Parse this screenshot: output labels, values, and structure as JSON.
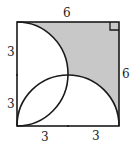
{
  "diagram": {
    "type": "geometry",
    "shape": "square",
    "shaded_region_color": "#c8c8c8",
    "stroke_color": "#1a1a1a",
    "labels": {
      "top": "6",
      "right": "6",
      "left_upper": "3",
      "left_lower": "3",
      "bottom_left": "3",
      "bottom_right": "3"
    },
    "right_angle_marker": "top-right corner"
  }
}
